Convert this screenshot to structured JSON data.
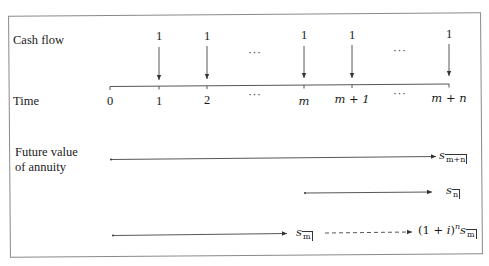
{
  "diagram": {
    "row_labels": {
      "cash_flow": "Cash flow",
      "time": "Time",
      "future_value_line1": "Future value",
      "future_value_line2": "of annuity"
    },
    "time_axis": {
      "ticks": [
        {
          "label": "0",
          "x": 110,
          "payment": null
        },
        {
          "label": "1",
          "x": 159,
          "payment": "1"
        },
        {
          "label": "2",
          "x": 207,
          "payment": "1"
        },
        {
          "label": "···",
          "x": 255,
          "payment": "···",
          "ellipsis": true
        },
        {
          "label": "m",
          "x": 304,
          "payment": "1"
        },
        {
          "label": "m + 1",
          "x": 352,
          "payment": "1"
        },
        {
          "label": "···",
          "x": 400,
          "payment": "···",
          "ellipsis": true
        },
        {
          "label": "m + n",
          "x": 449,
          "payment": "1"
        }
      ]
    },
    "cash_flow_values": [
      "1",
      "1",
      "1",
      "1",
      "1"
    ],
    "future_value_rows": [
      {
        "from_x": 111,
        "to_x": 436,
        "label": "s",
        "subscript": "m+n",
        "style": "solid"
      },
      {
        "from_x": 305,
        "to_x": 432,
        "label": "s",
        "subscript": "n",
        "style": "solid"
      },
      {
        "from_x": 113,
        "to_x": 287,
        "label": "s",
        "subscript": "m",
        "style": "solid"
      }
    ],
    "accumulation": {
      "style": "dashed",
      "factor_prefix": "(1 + ",
      "factor_var": "i",
      "factor_suffix": ")",
      "exponent": "n",
      "label": "s",
      "subscript": "m"
    },
    "colors": {
      "line": "#333333",
      "frame": "#8a8a8a",
      "text": "#1a1a1a"
    }
  }
}
